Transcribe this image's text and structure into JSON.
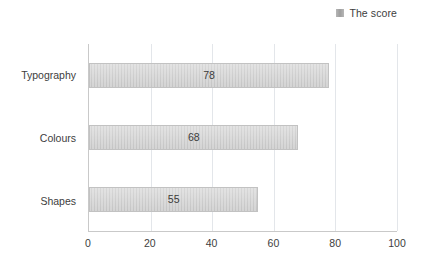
{
  "legend": {
    "position": "top-right",
    "swatch_icon": "legend-square-icon",
    "entries": [
      {
        "label": "The score",
        "color": "#aaaaaa"
      }
    ]
  },
  "chart_data": {
    "type": "bar",
    "orientation": "horizontal",
    "title": "",
    "subtitle": "",
    "xlabel": "",
    "ylabel": "",
    "categories": [
      "Shapes",
      "Colours",
      "Typography"
    ],
    "series": [
      {
        "name": "The score",
        "values": [
          55,
          68,
          78
        ],
        "color": "#cfcfcf"
      }
    ],
    "data_labels": [
      "55",
      "68",
      "78"
    ],
    "xlim": [
      0,
      100
    ],
    "xticks": [
      0,
      20,
      40,
      60,
      80,
      100
    ],
    "xtick_labels": [
      "0",
      "20",
      "40",
      "60",
      "80",
      "100"
    ],
    "grid": {
      "vertical": true,
      "horizontal": false
    },
    "legend_position": "top-right"
  },
  "axis": {
    "x_ticks": [
      {
        "label": "0",
        "value": 0
      },
      {
        "label": "20",
        "value": 20
      },
      {
        "label": "40",
        "value": 40
      },
      {
        "label": "60",
        "value": 60
      },
      {
        "label": "80",
        "value": 80
      },
      {
        "label": "100",
        "value": 100
      }
    ]
  },
  "bars": [
    {
      "category": "Typography",
      "value": 78,
      "label": "78"
    },
    {
      "category": "Colours",
      "value": 68,
      "label": "68"
    },
    {
      "category": "Shapes",
      "value": 55,
      "label": "55"
    }
  ],
  "colors": {
    "bar_fill": "#cfcfcf",
    "bar_border": "#c2c2c2",
    "gridline": "#e3e6ea",
    "axis_line": "#c9c9c9",
    "text": "#3d3d3d",
    "background": "#ffffff"
  }
}
